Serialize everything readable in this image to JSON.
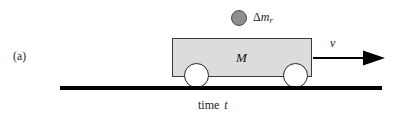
{
  "figure": {
    "panel_label": "(a)",
    "caption_text": "time",
    "caption_variable": "t",
    "background_color": "#ffffff"
  },
  "cart": {
    "mass_label": "M",
    "body_fill_color": "#dcdcdc",
    "body_border_color": "#3a3a3a",
    "wheel_fill_color": "#ffffff",
    "wheel_border_color": "#222222",
    "wheel_front_name": "front-wheel",
    "wheel_rear_name": "rear-wheel"
  },
  "particle": {
    "symbol_delta": "Δ",
    "symbol_mass": "m",
    "symbol_subscript": "r",
    "sphere_fill_color": "#8e8e8e",
    "sphere_border_color": "#4a4a4a"
  },
  "velocity": {
    "label": "v",
    "arrow_direction": "right",
    "arrow_color": "#000000"
  },
  "ground": {
    "color": "#000000"
  }
}
